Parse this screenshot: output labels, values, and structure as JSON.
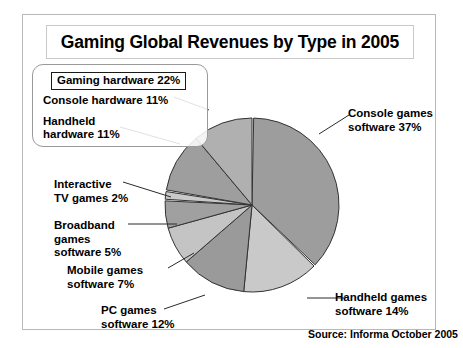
{
  "title": "Gaming Global Revenues by Type in 2005",
  "source_note": "Source: Informa October 2005",
  "hardware_group": {
    "summary_label": "Gaming hardware 22%",
    "console_hardware_label": "Console hardware 11%",
    "handheld_hardware_label": "Handheld\nhardware 11%"
  },
  "callouts": {
    "console_games": "Console games\nsoftware 37%",
    "handheld_games": "Handheld games\nsoftware 14%",
    "interactive_tv": "Interactive\nTV games 2%",
    "broadband": "Broadband\ngames\nsoftware 5%",
    "mobile_games": "Mobile games\nsoftware 7%",
    "pc_games": "PC games\nsoftware 12%"
  },
  "chart_data": {
    "type": "pie",
    "title": "Gaming Global Revenues by Type in 2005",
    "subtitle": "",
    "units": "percent of global gaming revenues",
    "legend_position": "callout-labels",
    "start_angle_deg": 0,
    "direction": "clockwise",
    "total": 100,
    "categories": [
      "Console games software",
      "Handheld games software",
      "PC games software",
      "Mobile games software",
      "Broadband games software",
      "Interactive TV games",
      "Handheld hardware",
      "Console hardware"
    ],
    "values": [
      37,
      14,
      12,
      7,
      5,
      2,
      11,
      11
    ],
    "slice_colors": [
      "#9d9d9d",
      "#c9c9c9",
      "#9a9a9a",
      "#c4c4c4",
      "#a0a0a0",
      "#c9c9c9",
      "#9e9e9e",
      "#b0b0b0"
    ],
    "separator_color": "#ffffff",
    "grouped_totals": [
      {
        "name": "Gaming hardware",
        "value": 22
      }
    ],
    "annotations": [
      "Gaming hardware 22%",
      "Console hardware 11%",
      "Handheld hardware 11%",
      "Console games software 37%",
      "Handheld games software 14%",
      "PC games software 12%",
      "Mobile games software 7%",
      "Broadband games software 5%",
      "Interactive TV games 2%",
      "Source: Informa October 2005"
    ]
  },
  "geometry": {
    "cx": 229,
    "cy": 190,
    "r": 87
  }
}
